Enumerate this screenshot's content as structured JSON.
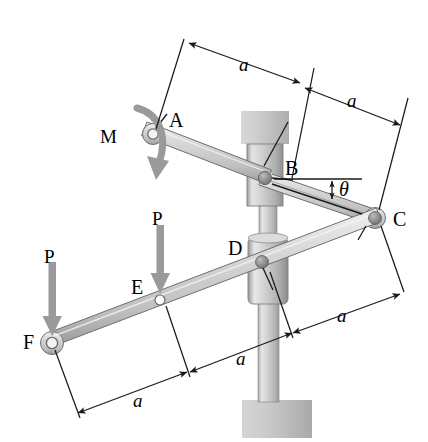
{
  "figure": {
    "background_color": "#ffffff",
    "line_color": "#1a1a1a",
    "bar_fill_light": "#e8e8e8",
    "bar_fill_mid": "#c9c9c9",
    "bar_fill_dark": "#a8a8a8",
    "force_arrow_color": "#9a9a9a",
    "moment_arrow_color": "#9a9a9a",
    "pin_color": "#8f8f8f",
    "post_color": "#bdbdbd",
    "collar_color": "#cccccc"
  },
  "points": [
    {
      "id": "A",
      "label": "A",
      "x": 153,
      "y": 134,
      "label_x": 169,
      "label_y": 110
    },
    {
      "id": "B",
      "label": "B",
      "x": 265,
      "y": 178,
      "label_x": 285,
      "label_y": 158
    },
    {
      "id": "C",
      "label": "C",
      "x": 375,
      "y": 218,
      "label_x": 393,
      "label_y": 209
    },
    {
      "id": "D",
      "label": "D",
      "x": 262,
      "y": 262,
      "label_x": 228,
      "label_y": 238
    },
    {
      "id": "E",
      "label": "E",
      "x": 160,
      "y": 300,
      "label_x": 131,
      "label_y": 277
    },
    {
      "id": "F",
      "label": "F",
      "x": 52,
      "y": 343,
      "label_x": 23,
      "label_y": 332
    }
  ],
  "loads": [
    {
      "id": "M",
      "label": "M",
      "type": "moment",
      "sense": "clockwise",
      "label_x": 100,
      "label_y": 127
    },
    {
      "id": "P-at-F",
      "label": "P",
      "type": "force",
      "direction": "down",
      "applied_at": "F",
      "label_x": 44,
      "label_y": 247
    },
    {
      "id": "P-at-E",
      "label": "P",
      "type": "force",
      "direction": "down",
      "applied_at": "E",
      "label_x": 152,
      "label_y": 209
    }
  ],
  "angles": [
    {
      "id": "theta",
      "label": "θ",
      "at": "B",
      "reference": "horizontal",
      "label_x": 339,
      "label_y": 179
    }
  ],
  "dimensions": [
    {
      "id": "dim-a-top-left",
      "label": "a",
      "from": "A",
      "to": "B",
      "label_x": 239,
      "label_y": 55
    },
    {
      "id": "dim-a-top-right",
      "label": "a",
      "from": "B",
      "to": "C",
      "label_x": 347,
      "label_y": 91
    },
    {
      "id": "dim-a-bottom-right",
      "label": "a",
      "from": "D",
      "to": "C",
      "label_x": 337,
      "label_y": 306
    },
    {
      "id": "dim-a-bottom-mid",
      "label": "a",
      "from": "E",
      "to": "D",
      "label_x": 236,
      "label_y": 349
    },
    {
      "id": "dim-a-bottom-left",
      "label": "a",
      "from": "F",
      "to": "E",
      "label_x": 133,
      "label_y": 391
    }
  ],
  "components": [
    {
      "id": "bar-AC",
      "name": "upper-bar",
      "endpoints": [
        "A",
        "C"
      ],
      "via": "B"
    },
    {
      "id": "bar-FC",
      "name": "lower-bar",
      "endpoints": [
        "F",
        "C"
      ],
      "via": [
        "E",
        "D"
      ]
    },
    {
      "id": "post",
      "name": "vertical-post"
    },
    {
      "id": "collar-B",
      "name": "upper-collar"
    },
    {
      "id": "collar-D",
      "name": "lower-collar"
    },
    {
      "id": "base",
      "name": "ground-base"
    }
  ]
}
